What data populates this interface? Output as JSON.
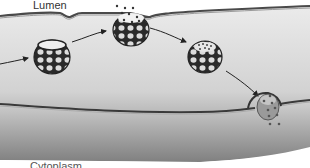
{
  "diagram": {
    "labels": {
      "top": "Lumen",
      "bottom": "Cytoplasm"
    },
    "stages": [
      {
        "id": "vesicle-intact",
        "description": "coated vesicle with open top"
      },
      {
        "id": "vesicle-release",
        "description": "vesicle fused to upper membrane releasing cargo"
      },
      {
        "id": "vesicle-loaded",
        "description": "vesicle filled with particles"
      },
      {
        "id": "vesicle-fusing",
        "description": "vesicle fusing with lower membrane releasing particles"
      }
    ],
    "colors": {
      "background": "#ffffff",
      "cell_fill_top": "#e4e4e4",
      "cell_fill_bottom": "#8a8a8a",
      "membrane": "#555555",
      "vesicle_frame": "#2a2a2a",
      "vesicle_cell": "#d8d8d8",
      "particles": "#444444"
    }
  }
}
